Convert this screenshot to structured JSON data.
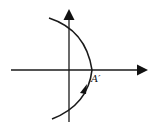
{
  "diagram": {
    "type": "coordinate-plot",
    "axes": {
      "x_axis": {
        "direction": "right",
        "has_arrow": true
      },
      "y_axis": {
        "direction": "up",
        "has_arrow": true
      }
    },
    "curve": {
      "shape": "arc opening left, vertex on positive x-axis",
      "direction_arrow": "upward along lower branch toward vertex"
    },
    "labels": {
      "point": "A′"
    },
    "colors": {
      "stroke": "#1a1a1a",
      "background": "#ffffff"
    }
  }
}
